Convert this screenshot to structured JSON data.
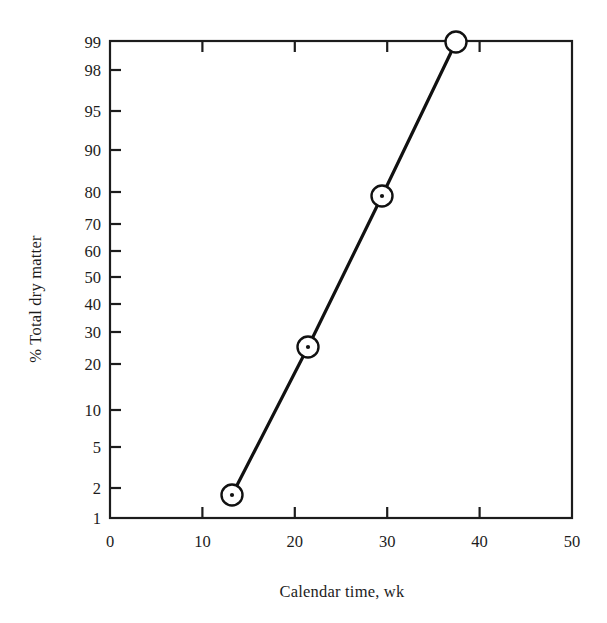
{
  "chart_data": {
    "type": "scatter",
    "title": "",
    "xlabel": "Calendar time, wk",
    "ylabel": "% Total dry matter",
    "xlim": [
      0,
      50
    ],
    "ylim": [
      1,
      99
    ],
    "yscale": "probability",
    "grid": false,
    "legend": "none",
    "marker": "circle-with-center-dot",
    "line": "solid-connected",
    "x_ticks": [
      {
        "value": 0,
        "label": "0"
      },
      {
        "value": 10,
        "label": "10"
      },
      {
        "value": 20,
        "label": "20"
      },
      {
        "value": 30,
        "label": "30"
      },
      {
        "value": 40,
        "label": "40"
      },
      {
        "value": 50,
        "label": "50"
      }
    ],
    "y_ticks": [
      {
        "value": 1,
        "label": "1",
        "py": 518
      },
      {
        "value": 2,
        "label": "2",
        "py": 488
      },
      {
        "value": 5,
        "label": "5",
        "py": 447
      },
      {
        "value": 10,
        "label": "10",
        "py": 410
      },
      {
        "value": 20,
        "label": "20",
        "py": 364
      },
      {
        "value": 30,
        "label": "30",
        "py": 332
      },
      {
        "value": 40,
        "label": "40",
        "py": 304
      },
      {
        "value": 50,
        "label": "50",
        "py": 277
      },
      {
        "value": 60,
        "label": "60",
        "py": 251
      },
      {
        "value": 70,
        "label": "70",
        "py": 224
      },
      {
        "value": 80,
        "label": "80",
        "py": 192
      },
      {
        "value": 90,
        "label": "90",
        "py": 150
      },
      {
        "value": 95,
        "label": "95",
        "py": 111
      },
      {
        "value": 98,
        "label": "98",
        "py": 70
      },
      {
        "value": 99,
        "label": "99",
        "py": 42
      }
    ],
    "series": [
      {
        "name": "Total dry matter accumulation",
        "x": [
          13.2,
          21.4,
          29.4,
          37.4
        ],
        "y": [
          1.7,
          25.0,
          79.0,
          99.0
        ],
        "px": [
          232,
          308,
          382,
          456
        ],
        "py": [
          495,
          347,
          196,
          42
        ]
      }
    ]
  },
  "colors": {
    "axis": "#1c1c1c",
    "line": "#111111",
    "marker_stroke": "#111111",
    "marker_fill": "#ffffff",
    "background": "#ffffff"
  }
}
